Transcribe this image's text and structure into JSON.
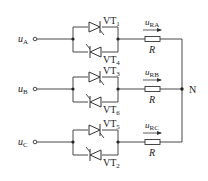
{
  "diagram": {
    "phases": [
      {
        "input_label": "u",
        "input_sub": "A",
        "upper_thyristor": "VT",
        "upper_sub": "1",
        "lower_thyristor": "VT",
        "lower_sub": "4",
        "voltage_label": "u",
        "voltage_sub": "RA",
        "resistor": "R"
      },
      {
        "input_label": "u",
        "input_sub": "B",
        "upper_thyristor": "VT",
        "upper_sub": "3",
        "lower_thyristor": "VT",
        "lower_sub": "6",
        "voltage_label": "u",
        "voltage_sub": "RB",
        "resistor": "R"
      },
      {
        "input_label": "u",
        "input_sub": "C",
        "upper_thyristor": "VT",
        "upper_sub": "5",
        "lower_thyristor": "VT",
        "lower_sub": "2",
        "voltage_label": "u",
        "voltage_sub": "RC",
        "resistor": "R"
      }
    ],
    "neutral_label": "N",
    "line_color": "#333333"
  }
}
